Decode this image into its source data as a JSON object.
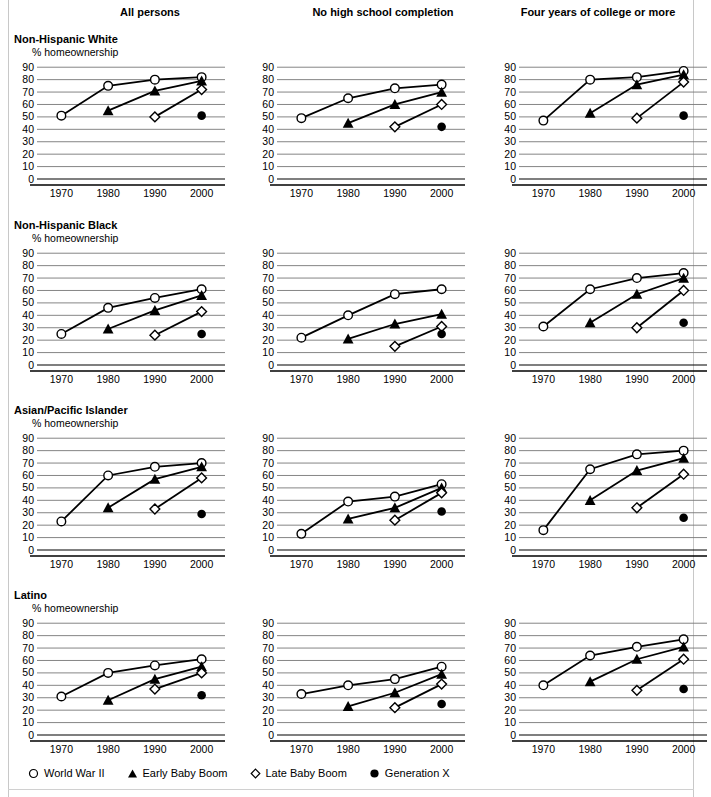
{
  "figure": {
    "column_headers": [
      "All persons",
      "No high school completion",
      "Four years of college or more"
    ],
    "row_labels": [
      "Non-Hispanic White",
      "Non-Hispanic Black",
      "Asian/Pacific Islander",
      "Latino"
    ],
    "axis_title": "% homeownership",
    "legend": [
      {
        "marker": "open-circle",
        "label": "World War II"
      },
      {
        "marker": "filled-triangle",
        "label": "Early Baby Boom"
      },
      {
        "marker": "open-diamond",
        "label": "Late Baby Boom"
      },
      {
        "marker": "filled-circle",
        "label": "Generation X"
      }
    ]
  },
  "chart_data": {
    "type": "line",
    "xlabel": "",
    "ylabel": "% homeownership",
    "x": [
      1970,
      1980,
      1990,
      2000
    ],
    "xlim": [
      1965,
      2005
    ],
    "ylim": [
      0,
      95
    ],
    "yticks": [
      0,
      10,
      20,
      30,
      40,
      50,
      60,
      70,
      80,
      90
    ],
    "grid": "horizontal",
    "legend_position": "bottom",
    "series_names": [
      "World War II",
      "Early Baby Boom",
      "Late Baby Boom",
      "Generation X"
    ],
    "panels": [
      {
        "row": "Non-Hispanic White",
        "column": "All persons",
        "series": [
          {
            "name": "World War II",
            "marker": "open-circle",
            "x": [
              1970,
              1980,
              1990,
              2000
            ],
            "values": [
              51,
              75,
              80,
              82
            ]
          },
          {
            "name": "Early Baby Boom",
            "marker": "filled-triangle",
            "x": [
              1980,
              1990,
              2000
            ],
            "values": [
              55,
              71,
              79
            ]
          },
          {
            "name": "Late Baby Boom",
            "marker": "open-diamond",
            "x": [
              1990,
              2000
            ],
            "values": [
              50,
              72
            ]
          },
          {
            "name": "Generation X",
            "marker": "filled-circle",
            "x": [
              2000
            ],
            "values": [
              51
            ]
          }
        ]
      },
      {
        "row": "Non-Hispanic White",
        "column": "No high school completion",
        "series": [
          {
            "name": "World War II",
            "marker": "open-circle",
            "x": [
              1970,
              1980,
              1990,
              2000
            ],
            "values": [
              49,
              65,
              73,
              76
            ]
          },
          {
            "name": "Early Baby Boom",
            "marker": "filled-triangle",
            "x": [
              1980,
              1990,
              2000
            ],
            "values": [
              45,
              60,
              70
            ]
          },
          {
            "name": "Late Baby Boom",
            "marker": "open-diamond",
            "x": [
              1990,
              2000
            ],
            "values": [
              42,
              60
            ]
          },
          {
            "name": "Generation X",
            "marker": "filled-circle",
            "x": [
              2000
            ],
            "values": [
              42
            ]
          }
        ]
      },
      {
        "row": "Non-Hispanic White",
        "column": "Four years of college or more",
        "series": [
          {
            "name": "World War II",
            "marker": "open-circle",
            "x": [
              1970,
              1980,
              1990,
              2000
            ],
            "values": [
              47,
              80,
              82,
              87
            ]
          },
          {
            "name": "Early Baby Boom",
            "marker": "filled-triangle",
            "x": [
              1980,
              1990,
              2000
            ],
            "values": [
              53,
              76,
              84
            ]
          },
          {
            "name": "Late Baby Boom",
            "marker": "open-diamond",
            "x": [
              1990,
              2000
            ],
            "values": [
              49,
              78
            ]
          },
          {
            "name": "Generation X",
            "marker": "filled-circle",
            "x": [
              2000
            ],
            "values": [
              51
            ]
          }
        ]
      },
      {
        "row": "Non-Hispanic Black",
        "column": "All persons",
        "series": [
          {
            "name": "World War II",
            "marker": "open-circle",
            "x": [
              1970,
              1980,
              1990,
              2000
            ],
            "values": [
              25,
              46,
              54,
              61
            ]
          },
          {
            "name": "Early Baby Boom",
            "marker": "filled-triangle",
            "x": [
              1980,
              1990,
              2000
            ],
            "values": [
              29,
              44,
              56
            ]
          },
          {
            "name": "Late Baby Boom",
            "marker": "open-diamond",
            "x": [
              1990,
              2000
            ],
            "values": [
              24,
              43
            ]
          },
          {
            "name": "Generation X",
            "marker": "filled-circle",
            "x": [
              2000
            ],
            "values": [
              25
            ]
          }
        ]
      },
      {
        "row": "Non-Hispanic Black",
        "column": "No high school completion",
        "series": [
          {
            "name": "World War II",
            "marker": "open-circle",
            "x": [
              1970,
              1980,
              1990,
              2000
            ],
            "values": [
              22,
              40,
              57,
              61
            ]
          },
          {
            "name": "Early Baby Boom",
            "marker": "filled-triangle",
            "x": [
              1980,
              1990,
              2000
            ],
            "values": [
              21,
              33,
              41
            ]
          },
          {
            "name": "Late Baby Boom",
            "marker": "open-diamond",
            "x": [
              1990,
              2000
            ],
            "values": [
              15,
              31
            ]
          },
          {
            "name": "Generation X",
            "marker": "filled-circle",
            "x": [
              2000
            ],
            "values": [
              25
            ]
          }
        ]
      },
      {
        "row": "Non-Hispanic Black",
        "column": "Four years of college or more",
        "series": [
          {
            "name": "World War II",
            "marker": "open-circle",
            "x": [
              1970,
              1980,
              1990,
              2000
            ],
            "values": [
              31,
              61,
              70,
              74
            ]
          },
          {
            "name": "Early Baby Boom",
            "marker": "filled-triangle",
            "x": [
              1980,
              1990,
              2000
            ],
            "values": [
              34,
              57,
              70
            ]
          },
          {
            "name": "Late Baby Boom",
            "marker": "open-diamond",
            "x": [
              1990,
              2000
            ],
            "values": [
              30,
              60
            ]
          },
          {
            "name": "Generation X",
            "marker": "filled-circle",
            "x": [
              2000
            ],
            "values": [
              34
            ]
          }
        ]
      },
      {
        "row": "Asian/Pacific Islander",
        "column": "All persons",
        "series": [
          {
            "name": "World War II",
            "marker": "open-circle",
            "x": [
              1970,
              1980,
              1990,
              2000
            ],
            "values": [
              23,
              60,
              67,
              70
            ]
          },
          {
            "name": "Early Baby Boom",
            "marker": "filled-triangle",
            "x": [
              1980,
              1990,
              2000
            ],
            "values": [
              34,
              57,
              67
            ]
          },
          {
            "name": "Late Baby Boom",
            "marker": "open-diamond",
            "x": [
              1990,
              2000
            ],
            "values": [
              33,
              58
            ]
          },
          {
            "name": "Generation X",
            "marker": "filled-circle",
            "x": [
              2000
            ],
            "values": [
              29
            ]
          }
        ]
      },
      {
        "row": "Asian/Pacific Islander",
        "column": "No high school completion",
        "series": [
          {
            "name": "World War II",
            "marker": "open-circle",
            "x": [
              1970,
              1980,
              1990,
              2000
            ],
            "values": [
              13,
              39,
              43,
              53
            ]
          },
          {
            "name": "Early Baby Boom",
            "marker": "filled-triangle",
            "x": [
              1980,
              1990,
              2000
            ],
            "values": [
              25,
              34,
              50
            ]
          },
          {
            "name": "Late Baby Boom",
            "marker": "open-diamond",
            "x": [
              1990,
              2000
            ],
            "values": [
              24,
              46
            ]
          },
          {
            "name": "Generation X",
            "marker": "filled-circle",
            "x": [
              2000
            ],
            "values": [
              31
            ]
          }
        ]
      },
      {
        "row": "Asian/Pacific Islander",
        "column": "Four years of college or more",
        "series": [
          {
            "name": "World War II",
            "marker": "open-circle",
            "x": [
              1970,
              1980,
              1990,
              2000
            ],
            "values": [
              16,
              65,
              77,
              80
            ]
          },
          {
            "name": "Early Baby Boom",
            "marker": "filled-triangle",
            "x": [
              1980,
              1990,
              2000
            ],
            "values": [
              40,
              64,
              74
            ]
          },
          {
            "name": "Late Baby Boom",
            "marker": "open-diamond",
            "x": [
              1990,
              2000
            ],
            "values": [
              34,
              61
            ]
          },
          {
            "name": "Generation X",
            "marker": "filled-circle",
            "x": [
              2000
            ],
            "values": [
              26
            ]
          }
        ]
      },
      {
        "row": "Latino",
        "column": "All persons",
        "series": [
          {
            "name": "World War II",
            "marker": "open-circle",
            "x": [
              1970,
              1980,
              1990,
              2000
            ],
            "values": [
              31,
              50,
              56,
              61
            ]
          },
          {
            "name": "Early Baby Boom",
            "marker": "filled-triangle",
            "x": [
              1980,
              1990,
              2000
            ],
            "values": [
              28,
              45,
              55
            ]
          },
          {
            "name": "Late Baby Boom",
            "marker": "open-diamond",
            "x": [
              1990,
              2000
            ],
            "values": [
              37,
              50
            ]
          },
          {
            "name": "Generation X",
            "marker": "filled-circle",
            "x": [
              2000
            ],
            "values": [
              32
            ]
          }
        ]
      },
      {
        "row": "Latino",
        "column": "No high school completion",
        "series": [
          {
            "name": "World War II",
            "marker": "open-circle",
            "x": [
              1970,
              1980,
              1990,
              2000
            ],
            "values": [
              33,
              40,
              45,
              55
            ]
          },
          {
            "name": "Early Baby Boom",
            "marker": "filled-triangle",
            "x": [
              1980,
              1990,
              2000
            ],
            "values": [
              23,
              34,
              49
            ]
          },
          {
            "name": "Late Baby Boom",
            "marker": "open-diamond",
            "x": [
              1990,
              2000
            ],
            "values": [
              22,
              41
            ]
          },
          {
            "name": "Generation X",
            "marker": "filled-circle",
            "x": [
              2000
            ],
            "values": [
              25
            ]
          }
        ]
      },
      {
        "row": "Latino",
        "column": "Four years of college or more",
        "series": [
          {
            "name": "World War II",
            "marker": "open-circle",
            "x": [
              1970,
              1980,
              1990,
              2000
            ],
            "values": [
              40,
              64,
              71,
              77
            ]
          },
          {
            "name": "Early Baby Boom",
            "marker": "filled-triangle",
            "x": [
              1980,
              1990,
              2000
            ],
            "values": [
              43,
              61,
              71
            ]
          },
          {
            "name": "Late Baby Boom",
            "marker": "open-diamond",
            "x": [
              1990,
              2000
            ],
            "values": [
              36,
              61
            ]
          },
          {
            "name": "Generation X",
            "marker": "filled-circle",
            "x": [
              2000
            ],
            "values": [
              37
            ]
          }
        ]
      }
    ]
  }
}
